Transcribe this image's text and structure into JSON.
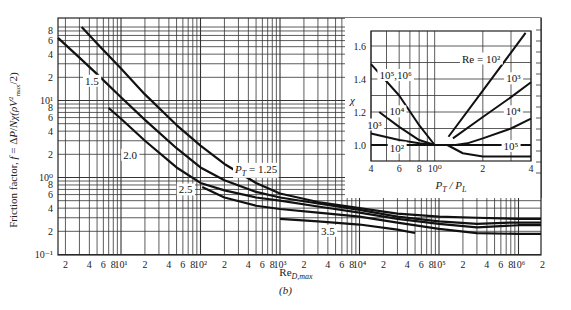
{
  "chart_data": [
    {
      "id": "main",
      "type": "line",
      "title": "",
      "xlabel": "Re_D,max",
      "ylabel": "Friction factor, f = ΔP/Nχ(ρV²max/2)",
      "xscale": "log",
      "yscale": "log",
      "xlim": [
        1.6,
        2000000
      ],
      "ylim": [
        0.1,
        90
      ],
      "grid": true,
      "x_ticks": [
        {
          "v": 2,
          "t": "2"
        },
        {
          "v": 4,
          "t": "4"
        },
        {
          "v": 6,
          "t": "6"
        },
        {
          "v": 8,
          "t": "8"
        },
        {
          "v": 10,
          "t": "10¹"
        },
        {
          "v": 20,
          "t": "2"
        },
        {
          "v": 40,
          "t": "4"
        },
        {
          "v": 60,
          "t": "6"
        },
        {
          "v": 80,
          "t": "8"
        },
        {
          "v": 100,
          "t": "10²"
        },
        {
          "v": 200,
          "t": "2"
        },
        {
          "v": 400,
          "t": "4"
        },
        {
          "v": 600,
          "t": "6"
        },
        {
          "v": 800,
          "t": "8"
        },
        {
          "v": 1000,
          "t": "10³"
        },
        {
          "v": 2000,
          "t": "2"
        },
        {
          "v": 4000,
          "t": "4"
        },
        {
          "v": 6000,
          "t": "6"
        },
        {
          "v": 8000,
          "t": "8"
        },
        {
          "v": 10000,
          "t": "10⁴"
        },
        {
          "v": 20000,
          "t": "2"
        },
        {
          "v": 40000,
          "t": "4"
        },
        {
          "v": 60000,
          "t": "6"
        },
        {
          "v": 80000,
          "t": "8"
        },
        {
          "v": 100000,
          "t": "10⁵"
        },
        {
          "v": 200000,
          "t": "2"
        },
        {
          "v": 400000,
          "t": "4"
        },
        {
          "v": 600000,
          "t": "6"
        },
        {
          "v": 800000,
          "t": "8"
        },
        {
          "v": 1000000,
          "t": "10⁶"
        },
        {
          "v": 2000000,
          "t": "2"
        }
      ],
      "y_ticks": [
        {
          "v": 0.1,
          "t": "10⁻¹"
        },
        {
          "v": 0.2,
          "t": "2"
        },
        {
          "v": 0.4,
          "t": "4"
        },
        {
          "v": 0.6,
          "t": "6"
        },
        {
          "v": 0.8,
          "t": "8"
        },
        {
          "v": 1,
          "t": "10⁰"
        },
        {
          "v": 2,
          "t": "2"
        },
        {
          "v": 4,
          "t": "4"
        },
        {
          "v": 6,
          "t": "6"
        },
        {
          "v": 8,
          "t": "8"
        },
        {
          "v": 10,
          "t": "10¹"
        },
        {
          "v": 20,
          "t": "2"
        },
        {
          "v": 40,
          "t": "4"
        },
        {
          "v": 60,
          "t": "6"
        },
        {
          "v": 80,
          "t": "8"
        }
      ],
      "series": [
        {
          "name": "P_T = 1.25",
          "points": [
            [
              3.2,
              90
            ],
            [
              5,
              55
            ],
            [
              10,
              26
            ],
            [
              20,
              12
            ],
            [
              50,
              4.8
            ],
            [
              100,
              2.6
            ],
            [
              200,
              1.5
            ],
            [
              500,
              0.85
            ],
            [
              1000,
              0.62
            ],
            [
              3000,
              0.48
            ],
            [
              10000,
              0.4
            ],
            [
              30000,
              0.34
            ],
            [
              100000,
              0.31
            ],
            [
              300000,
              0.3
            ],
            [
              1000000,
              0.29
            ],
            [
              2000000,
              0.29
            ]
          ]
        },
        {
          "name": "1.5",
          "points": [
            [
              1.6,
              65
            ],
            [
              3,
              36
            ],
            [
              5,
              22
            ],
            [
              10,
              11
            ],
            [
              20,
              5.6
            ],
            [
              50,
              2.4
            ],
            [
              100,
              1.35
            ],
            [
              200,
              0.92
            ],
            [
              500,
              0.65
            ],
            [
              1000,
              0.55
            ],
            [
              3000,
              0.46
            ],
            [
              10000,
              0.38
            ],
            [
              30000,
              0.31
            ],
            [
              100000,
              0.27
            ],
            [
              300000,
              0.25
            ],
            [
              800000,
              0.26
            ],
            [
              2000000,
              0.26
            ]
          ]
        },
        {
          "name": "2.0",
          "points": [
            [
              7,
              8
            ],
            [
              10,
              5.8
            ],
            [
              20,
              3.0
            ],
            [
              50,
              1.35
            ],
            [
              100,
              0.85
            ],
            [
              200,
              0.68
            ],
            [
              500,
              0.55
            ],
            [
              1000,
              0.5
            ],
            [
              3000,
              0.42
            ],
            [
              10000,
              0.35
            ],
            [
              30000,
              0.29
            ],
            [
              100000,
              0.25
            ],
            [
              300000,
              0.225
            ],
            [
              1000000,
              0.24
            ],
            [
              2000000,
              0.24
            ]
          ]
        },
        {
          "name": "2.5",
          "points": [
            [
              105,
              0.75
            ],
            [
              200,
              0.55
            ],
            [
              500,
              0.43
            ],
            [
              1000,
              0.39
            ],
            [
              3000,
              0.35
            ],
            [
              10000,
              0.31
            ],
            [
              30000,
              0.26
            ],
            [
              100000,
              0.215
            ],
            [
              300000,
              0.19
            ],
            [
              1000000,
              0.185
            ],
            [
              2000000,
              0.185
            ]
          ]
        },
        {
          "name": "3.5",
          "points": [
            [
              1000,
              0.29
            ],
            [
              3000,
              0.27
            ],
            [
              10000,
              0.245
            ],
            [
              30000,
              0.21
            ],
            [
              50000,
              0.19
            ]
          ]
        }
      ],
      "annotations": [
        {
          "text": "1.5",
          "x": 4.3,
          "y": 16
        },
        {
          "text": "2.0",
          "x": 13,
          "y": 1.75
        },
        {
          "text": "P_T = 1.25",
          "x": 500,
          "y": 1.15
        },
        {
          "text": "2.5",
          "x": 65,
          "y": 0.62
        },
        {
          "text": "3.5",
          "x": 4000,
          "y": 0.18
        },
        {
          "text": "1.0",
          "x": 180000,
          "y": 1.35
        }
      ]
    },
    {
      "id": "inset",
      "type": "line",
      "xlabel": "P_T / P_L",
      "ylabel": "χ",
      "xscale": "log",
      "yscale": "linear",
      "xlim": [
        0.4,
        4
      ],
      "ylim": [
        0.9,
        1.69
      ],
      "grid": true,
      "x_ticks": [
        {
          "v": 0.4,
          "t": "4"
        },
        {
          "v": 0.6,
          "t": "6"
        },
        {
          "v": 0.8,
          "t": "8"
        },
        {
          "v": 1.0,
          "t": "10⁰"
        },
        {
          "v": 2,
          "t": "2"
        },
        {
          "v": 4,
          "t": "4"
        }
      ],
      "x_grid": [
        0.4,
        0.5,
        0.6,
        0.7,
        0.8,
        0.9,
        1.0,
        2,
        3,
        4
      ],
      "y_ticks": [
        {
          "v": 1.0,
          "t": "1.0"
        },
        {
          "v": 1.2,
          "t": "1.2"
        },
        {
          "v": 1.4,
          "t": "1.4"
        },
        {
          "v": 1.6,
          "t": "1.6"
        }
      ],
      "y_grid": [
        0.9,
        1.0,
        1.1,
        1.2,
        1.3,
        1.4,
        1.5,
        1.6
      ],
      "series": [
        {
          "name": "Re = 10²",
          "points": [
            [
              0.4,
              1.0
            ],
            [
              1.0,
              1.0
            ],
            [
              1.3,
              1.0
            ],
            [
              2,
              1.0
            ],
            [
              4,
              1.0
            ]
          ]
        },
        {
          "name": "Re = 10² (right)",
          "points": [
            [
              1.22,
              1.05
            ],
            [
              2,
              1.33
            ],
            [
              3,
              1.56
            ],
            [
              3.7,
              1.68
            ]
          ]
        },
        {
          "name": "10³",
          "points": [
            [
              0.4,
              1.07
            ],
            [
              0.6,
              1.03
            ],
            [
              0.8,
              1.01
            ],
            [
              1.0,
              1.0
            ]
          ]
        },
        {
          "name": "10³ (right)",
          "points": [
            [
              1.3,
              1.04
            ],
            [
              2,
              1.17
            ],
            [
              3,
              1.29
            ],
            [
              4,
              1.38
            ]
          ]
        },
        {
          "name": "10⁴",
          "points": [
            [
              0.45,
              1.2
            ],
            [
              0.6,
              1.11
            ],
            [
              0.8,
              1.03
            ],
            [
              1.0,
              1.0
            ]
          ]
        },
        {
          "name": "10⁴ (right)",
          "points": [
            [
              1.35,
              1.0
            ],
            [
              1.6,
              1.01
            ],
            [
              2,
              1.04
            ],
            [
              3,
              1.1
            ],
            [
              4,
              1.16
            ]
          ]
        },
        {
          "name": "10⁵,10⁶",
          "points": [
            [
              0.4,
              1.49
            ],
            [
              0.6,
              1.3
            ],
            [
              0.8,
              1.12
            ],
            [
              1.0,
              1.0
            ],
            [
              1.2,
              1.0
            ],
            [
              1.5,
              0.95
            ],
            [
              2,
              0.93
            ],
            [
              4,
              0.93
            ]
          ]
        }
      ],
      "annotations": [
        {
          "text": "Re = 10²",
          "x": 1.95,
          "y": 1.5
        },
        {
          "text": "10⁵,10⁶",
          "x": 0.57,
          "y": 1.4
        },
        {
          "text": "10⁴",
          "x": 0.58,
          "y": 1.18
        },
        {
          "text": "10³",
          "x": 0.42,
          "y": 1.1
        },
        {
          "text": "10²",
          "x": 0.58,
          "y": 0.96
        },
        {
          "text": "10³",
          "x": 3.1,
          "y": 1.38
        },
        {
          "text": "10⁴",
          "x": 3.1,
          "y": 1.18
        },
        {
          "text": "10⁵",
          "x": 3.0,
          "y": 0.97
        }
      ]
    }
  ],
  "labels": {
    "ylabel": "Friction factor, f = ΔP/Nχ(ρV²max/2)",
    "xlabel_main": "Re",
    "xlabel_sub": "D,max",
    "inset_xlabel": "P_T / P_L",
    "inset_ylabel": "χ",
    "caption": "(b)"
  }
}
